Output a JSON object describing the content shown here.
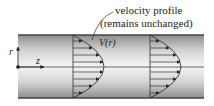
{
  "diagram": {
    "title_line1": "velocity profile",
    "title_line2": "(remains unchanged)",
    "profile_label": "V(r)",
    "axis_r": "r",
    "axis_z": "z",
    "colors": {
      "pipe_edge": "#555555",
      "pipe_fill_light": "#f2f2f2",
      "pipe_fill_dark": "#9a9a9a",
      "line": "#333333"
    },
    "profiles": [
      {
        "x_start": 73,
        "peak_x": 104
      },
      {
        "x_start": 150,
        "peak_x": 181
      }
    ]
  }
}
